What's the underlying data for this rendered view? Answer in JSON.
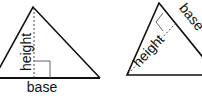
{
  "diagram": {
    "type": "triangle-base-height",
    "figures": [
      {
        "name": "upright-triangle",
        "base_label": "base",
        "height_label": "height"
      },
      {
        "name": "rotated-triangle",
        "base_label": "base",
        "height_label": "height"
      }
    ],
    "colors": {
      "stroke": "#111111",
      "background": "#ffffff"
    }
  }
}
